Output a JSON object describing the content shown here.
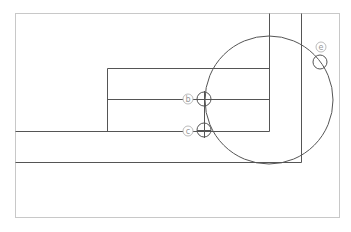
{
  "diagram": {
    "colors": {
      "frame": "#c8c8c8",
      "lines": "#555555",
      "labels": "#999999"
    },
    "markers": [
      {
        "id": "b",
        "label": "b"
      },
      {
        "id": "c",
        "label": "c"
      },
      {
        "id": "e",
        "label": "e"
      }
    ]
  }
}
